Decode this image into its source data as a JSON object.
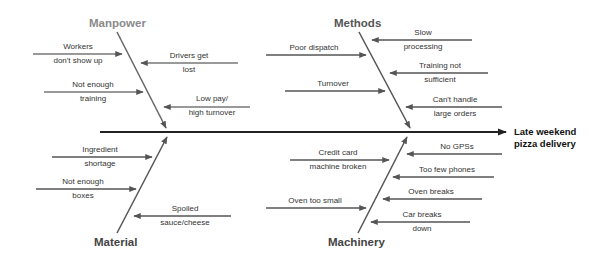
{
  "effect": {
    "line1": "Late weekend",
    "line2": "pizza delivery"
  },
  "categories": [
    {
      "id": "manpower",
      "label": "Manpower",
      "color": "#8a8a8a",
      "causes": [
        {
          "line1": "Workers",
          "line2": "don't show up"
        },
        {
          "line1": "Drivers get",
          "line2": "lost"
        },
        {
          "line1": "Not enough",
          "line2": "training"
        },
        {
          "line1": "Low pay/",
          "line2": "high turnover"
        }
      ]
    },
    {
      "id": "methods",
      "label": "Methods",
      "color": "#555555",
      "causes": [
        {
          "line1": "Slow",
          "line2": "processing"
        },
        {
          "line1": "Poor dispatch",
          "line2": ""
        },
        {
          "line1": "Training not",
          "line2": "sufficient"
        },
        {
          "line1": "Turnover",
          "line2": ""
        },
        {
          "line1": "Can't handle",
          "line2": "large orders"
        }
      ]
    },
    {
      "id": "material",
      "label": "Material",
      "color": "#444444",
      "causes": [
        {
          "line1": "Ingredient",
          "line2": "shortage"
        },
        {
          "line1": "Not enough",
          "line2": "boxes"
        },
        {
          "line1": "Spoiled",
          "line2": "sauce/cheese"
        }
      ]
    },
    {
      "id": "machinery",
      "label": "Machinery",
      "color": "#444444",
      "causes": [
        {
          "line1": "Credit card",
          "line2": "machine broken"
        },
        {
          "line1": "No GPSs",
          "line2": ""
        },
        {
          "line1": "Too few phones",
          "line2": ""
        },
        {
          "line1": "Oven too small",
          "line2": ""
        },
        {
          "line1": "Oven breaks",
          "line2": ""
        },
        {
          "line1": "Car breaks",
          "line2": "down"
        }
      ]
    }
  ]
}
